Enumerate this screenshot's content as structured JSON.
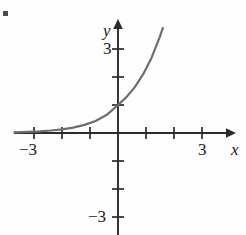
{
  "figure": {
    "marker": "square-bullet",
    "axis_color": "#2b2b2b",
    "curve_color": "#6d6d6d",
    "background": "#fdfdfd"
  },
  "labels": {
    "x_axis": "x",
    "y_axis": "y",
    "x_neg_three": "−3",
    "x_pos_three": "3",
    "y_pos_three": "3",
    "y_neg_three": "−3"
  },
  "chart_data": {
    "type": "line",
    "title": "",
    "xlabel": "x",
    "ylabel": "y",
    "xlim": [
      -3.7,
      3.9
    ],
    "ylim": [
      -3.9,
      4.0
    ],
    "grid": false,
    "legend": null,
    "xticks": [
      -3,
      -2,
      -1,
      0,
      1,
      2,
      3
    ],
    "yticks": [
      -3,
      -2,
      -1,
      0,
      1,
      2,
      3
    ],
    "xtick_labels": [
      "−3",
      "",
      "",
      "",
      "",
      "",
      "3"
    ],
    "ytick_labels": [
      "−3",
      "",
      "",
      "",
      "",
      "",
      "3"
    ],
    "series": [
      {
        "name": "exponential",
        "description": "increasing exponential curve, horizontal asymptote y = 0, y-intercept 1",
        "x": [
          -3.7,
          -3.2,
          -2.8,
          -2.4,
          -2.0,
          -1.6,
          -1.2,
          -0.8,
          -0.4,
          0.0,
          0.3,
          0.6,
          0.9,
          1.2,
          1.5,
          1.6
        ],
        "y": [
          0.02,
          0.04,
          0.06,
          0.09,
          0.13,
          0.19,
          0.29,
          0.43,
          0.65,
          1.0,
          1.28,
          1.64,
          2.1,
          2.69,
          3.45,
          3.75
        ]
      }
    ]
  }
}
